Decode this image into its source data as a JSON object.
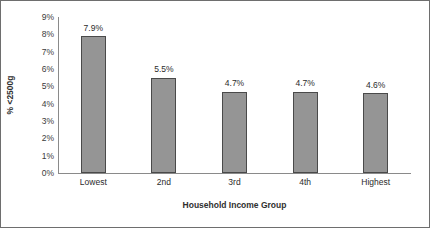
{
  "chart_data": {
    "type": "bar",
    "title": "",
    "subtitle": "",
    "categories": [
      "Lowest",
      "2nd",
      "3rd",
      "4th",
      "Highest"
    ],
    "values": [
      7.9,
      5.5,
      4.7,
      4.7,
      4.6
    ],
    "data_labels": [
      "7.9%",
      "5.5%",
      "4.7%",
      "4.7%",
      "4.6%"
    ],
    "xlabel": "Household Income Group",
    "ylabel": "% <2500g",
    "ylim": [
      0,
      9
    ],
    "ytick_labels": [
      "9%",
      "8%",
      "7%",
      "6%",
      "5%",
      "4%",
      "3%",
      "2%",
      "1%",
      "0%"
    ],
    "ytick_values": [
      9,
      8,
      7,
      6,
      5,
      4,
      3,
      2,
      1,
      0
    ],
    "grid": false,
    "legend": "none",
    "colors": {
      "bar_fill": "#959595",
      "bar_border": "#4a4a4a",
      "axis_line": "#8a8a8a",
      "frame_border": "#6e6e6e",
      "background": "#ffffff",
      "text": "#2b2b2b"
    }
  }
}
